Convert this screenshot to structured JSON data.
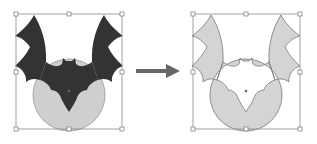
{
  "diagram": {
    "before": {
      "label": "",
      "bat_color": "#333333",
      "circle_color": "#cfcfcf"
    },
    "after": {
      "label": "",
      "fill_color": "#d4d4d4",
      "stroke_color": "#777777"
    },
    "arrow": {
      "direction": "right",
      "color": "#666666"
    },
    "selection_box_color": "#8a8a8a"
  }
}
